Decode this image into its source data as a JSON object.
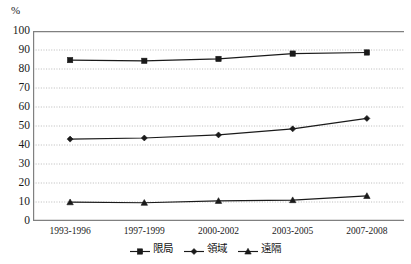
{
  "chart_data": {
    "type": "line",
    "title": "",
    "subtitle": "",
    "xlabel": "",
    "ylabel": "%",
    "unit_label": "%",
    "categories": [
      "1993-1996",
      "1997-1999",
      "2000-2002",
      "2003-2005",
      "2007-2008"
    ],
    "series": [
      {
        "name": "限局",
        "values": [
          84.7,
          84.3,
          85.3,
          88.1,
          88.7
        ],
        "marker": "square",
        "color": "#1a1a1a"
      },
      {
        "name": "領域",
        "values": [
          43.1,
          43.7,
          45.3,
          48.5,
          54.0
        ],
        "marker": "diamond",
        "color": "#1a1a1a"
      },
      {
        "name": "遠隔",
        "values": [
          9.9,
          9.6,
          10.6,
          11.0,
          13.2
        ],
        "marker": "triangle",
        "color": "#1a1a1a"
      }
    ],
    "ylim": [
      0,
      100
    ],
    "ytick_step": 10,
    "yticks": [
      "100",
      "90",
      "80",
      "70",
      "60",
      "50",
      "40",
      "30",
      "20",
      "10",
      "0"
    ],
    "grid": "horizontal-dotted",
    "legend_position": "bottom-center",
    "axis_color": "#808080",
    "grid_color": "#b0b0b0",
    "line_color": "#1a1a1a",
    "background_color": "#ffffff"
  }
}
